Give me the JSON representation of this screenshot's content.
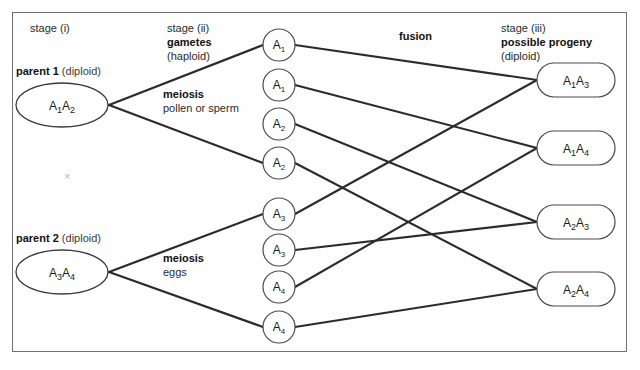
{
  "figure": {
    "stage_i_label": "stage (i)",
    "stage_ii_label": "stage (ii)",
    "stage_iii_label": "stage (iii)",
    "gametes_label": "gametes",
    "gametes_sub": "(haploid)",
    "progeny_label": "possible progeny",
    "progeny_sub": "(diploid)",
    "fusion_label": "fusion",
    "cross_symbol": "×",
    "border_color": "#6f6f6f",
    "line_color": "#2b2b2b",
    "text_color": "#2b2b2b"
  },
  "parents": [
    {
      "id": "parent-1",
      "name_bold": "parent 1",
      "name_norm": " (diploid)",
      "allele_a": "A",
      "sub_a": "1",
      "allele_b": "A",
      "sub_b": "2",
      "genotype": "A1A2",
      "cx": 62,
      "cy": 105,
      "rx": 46,
      "ry": 22,
      "meiosis_bold": "meiosis",
      "meiosis_sub": "pollen or sperm",
      "meiosis_x": 163,
      "meiosis_y": 88
    },
    {
      "id": "parent-2",
      "name_bold": "parent 2",
      "name_norm": " (diploid)",
      "allele_a": "A",
      "sub_a": "3",
      "allele_b": "A",
      "sub_b": "4",
      "genotype": "A3A4",
      "cx": 62,
      "cy": 272,
      "rx": 46,
      "ry": 22,
      "meiosis_bold": "meiosis",
      "meiosis_sub": "eggs",
      "meiosis_x": 163,
      "meiosis_y": 252
    }
  ],
  "gametes": [
    {
      "id": "gamete-1",
      "allele": "A",
      "sub": "1",
      "label": "A1",
      "cx": 279,
      "cy": 45,
      "r": 16,
      "parent": "parent-1",
      "progeny": "progeny-1"
    },
    {
      "id": "gamete-2",
      "allele": "A",
      "sub": "1",
      "label": "A1",
      "cx": 279,
      "cy": 85,
      "r": 16,
      "parent": "parent-1",
      "progeny": "progeny-2"
    },
    {
      "id": "gamete-3",
      "allele": "A",
      "sub": "2",
      "label": "A2",
      "cx": 279,
      "cy": 124,
      "r": 16,
      "parent": "parent-1",
      "progeny": "progeny-3"
    },
    {
      "id": "gamete-4",
      "allele": "A",
      "sub": "2",
      "label": "A2",
      "cx": 279,
      "cy": 163,
      "r": 16,
      "parent": "parent-1",
      "progeny": "progeny-4"
    },
    {
      "id": "gamete-5",
      "allele": "A",
      "sub": "3",
      "label": "A3",
      "cx": 279,
      "cy": 214,
      "r": 16,
      "parent": "parent-2",
      "progeny": "progeny-1"
    },
    {
      "id": "gamete-6",
      "allele": "A",
      "sub": "3",
      "label": "A3",
      "cx": 279,
      "cy": 250,
      "r": 16,
      "parent": "parent-2",
      "progeny": "progeny-3"
    },
    {
      "id": "gamete-7",
      "allele": "A",
      "sub": "4",
      "label": "A4",
      "cx": 279,
      "cy": 287,
      "r": 16,
      "parent": "parent-2",
      "progeny": "progeny-2"
    },
    {
      "id": "gamete-8",
      "allele": "A",
      "sub": "4",
      "label": "A4",
      "cx": 279,
      "cy": 327,
      "r": 16,
      "parent": "parent-2",
      "progeny": "progeny-4"
    }
  ],
  "progeny": [
    {
      "id": "progeny-1",
      "allele_a": "A",
      "sub_a": "1",
      "allele_b": "A",
      "sub_b": "3",
      "genotype": "A1A3",
      "x": 537,
      "y": 63,
      "w": 78,
      "h": 34
    },
    {
      "id": "progeny-2",
      "allele_a": "A",
      "sub_a": "1",
      "allele_b": "A",
      "sub_b": "4",
      "genotype": "A1A4",
      "x": 537,
      "y": 131,
      "w": 78,
      "h": 34
    },
    {
      "id": "progeny-3",
      "allele_a": "A",
      "sub_a": "2",
      "allele_b": "A",
      "sub_b": "3",
      "genotype": "A2A3",
      "x": 537,
      "y": 205,
      "w": 78,
      "h": 34
    },
    {
      "id": "progeny-4",
      "allele_a": "A",
      "sub_a": "2",
      "allele_b": "A",
      "sub_b": "4",
      "genotype": "A2A4",
      "x": 537,
      "y": 272,
      "w": 78,
      "h": 34
    }
  ],
  "headers": {
    "stage_i_x": 30,
    "stage_i_y": 22,
    "stage_ii_x": 167,
    "stage_ii_y": 22,
    "stage_iii_x": 501,
    "stage_iii_y": 22,
    "fusion_x": 399,
    "fusion_y": 30
  }
}
